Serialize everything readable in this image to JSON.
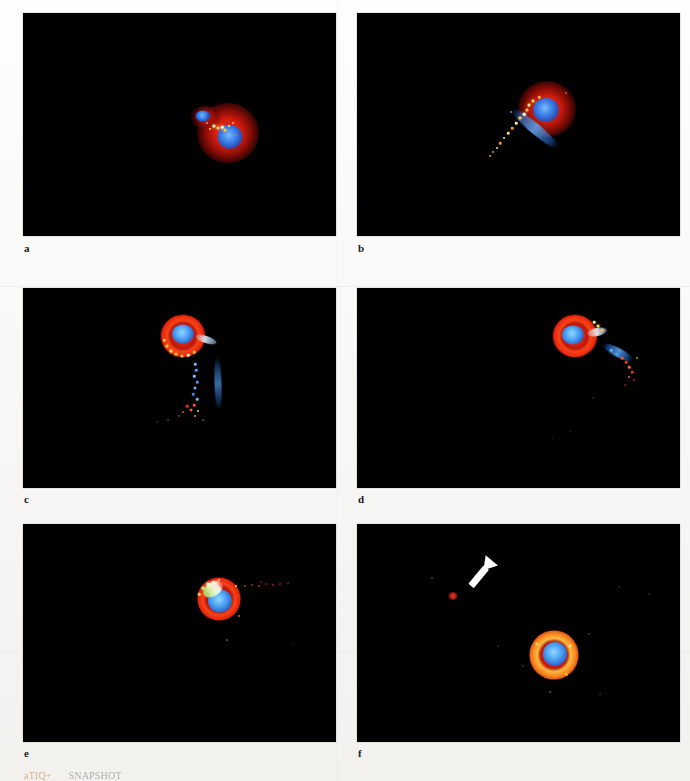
{
  "figure": {
    "type": "fluorescence-micrograph-panel-grid",
    "rows": 3,
    "columns": 2,
    "background_color": "#f5f4f1",
    "panel_background_color": "#000000",
    "channel_colors": {
      "nucleus_blue": "#2f82f5",
      "cytoplasm_red": "#e4230e",
      "puncta_yellow": "#ffc846",
      "puncta_green": "#7fe04a",
      "puncta_white": "#ffffff",
      "arrow_white": "#ffffff"
    },
    "panels": [
      {
        "label": "a",
        "description": "Two adjacent cells, red cytoplasm with blue nucleus; bright yellow-white puncta cluster at the cell-cell junction",
        "has_arrow": false,
        "has_tail": false
      },
      {
        "label": "b",
        "description": "Single cell with red cytoplasm and blue nucleus extending an elongated blue uropod tail toward the lower left, studded with yellow and white puncta",
        "has_arrow": false,
        "has_tail": true
      },
      {
        "label": "c",
        "description": "Cell with bright red ring and blue nucleus; a long vertical trail of blue and red puncta descends below the cell body",
        "has_arrow": false,
        "has_tail": true
      },
      {
        "label": "d",
        "description": "Cell with red ring and blue nucleus; a blue pseudopod and scattered red puncta trail toward the lower right",
        "has_arrow": false,
        "has_tail": true
      },
      {
        "label": "e",
        "description": "Cell with brilliant blue nucleus, red ring and a green-white crescent on the upper left; a faint horizontal red punctate trail extends to the right",
        "has_arrow": false,
        "has_tail": true
      },
      {
        "label": "f",
        "description": "Large cell with golden-orange ring and blue nucleus at centre; a white arrow marks an isolated red punctum in the upper left field",
        "has_arrow": true,
        "has_tail": false
      }
    ]
  },
  "caption": {
    "superscript": "aTIQ+",
    "rest": "SNAPSHOT",
    "visible_note": "partially cropped at page edge"
  }
}
